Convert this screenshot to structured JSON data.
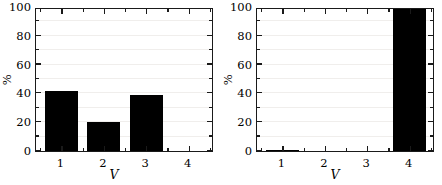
{
  "figure": {
    "background_color": "#ffffff",
    "bar_color": "#000000",
    "axis_color": "#1a1a1a",
    "grid_color": "#f0eeec",
    "panel_count": 2
  },
  "chart_data": [
    {
      "type": "bar",
      "panel": "left",
      "title": "",
      "xlabel": "V",
      "ylabel": "%",
      "categories": [
        "1",
        "2",
        "3",
        "4"
      ],
      "values": [
        42,
        20,
        39,
        0
      ],
      "xlim": [
        0.4,
        4.6
      ],
      "ylim": [
        0,
        100
      ],
      "ytick_labels": [
        "0",
        "20",
        "40",
        "60",
        "80",
        "100"
      ],
      "ytick_values": [
        0,
        20,
        40,
        60,
        80,
        100
      ],
      "yminor_values": [
        10,
        30,
        50,
        70,
        90
      ],
      "xtick_labels": [
        "1",
        "2",
        "3",
        "4"
      ],
      "xtick_values": [
        1,
        2,
        3,
        4
      ],
      "grid": true,
      "legend": "none",
      "bar_width": 0.78
    },
    {
      "type": "bar",
      "panel": "right",
      "title": "",
      "xlabel": "V",
      "ylabel": "%",
      "categories": [
        "1",
        "2",
        "3",
        "4"
      ],
      "values": [
        0.6,
        0,
        0,
        100
      ],
      "xlim": [
        0.4,
        4.6
      ],
      "ylim": [
        0,
        100
      ],
      "ytick_labels": [
        "0",
        "20",
        "40",
        "60",
        "80",
        "100"
      ],
      "ytick_values": [
        0,
        20,
        40,
        60,
        80,
        100
      ],
      "yminor_values": [
        10,
        30,
        50,
        70,
        90
      ],
      "xtick_labels": [
        "1",
        "2",
        "3",
        "4"
      ],
      "xtick_values": [
        1,
        2,
        3,
        4
      ],
      "grid": true,
      "legend": "none",
      "bar_width": 0.78
    }
  ]
}
